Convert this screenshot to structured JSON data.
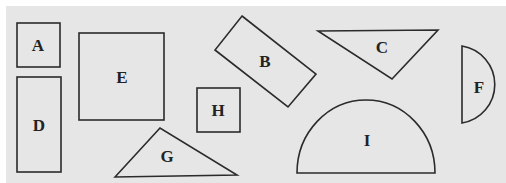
{
  "figure": {
    "background": "#e6e6e6",
    "stroke": "#2b2b2b",
    "shapes": [
      {
        "label": "A",
        "type": "square"
      },
      {
        "label": "B",
        "type": "rotated-rectangle"
      },
      {
        "label": "C",
        "type": "triangle"
      },
      {
        "label": "D",
        "type": "rectangle"
      },
      {
        "label": "E",
        "type": "square"
      },
      {
        "label": "F",
        "type": "semicircle"
      },
      {
        "label": "G",
        "type": "triangle"
      },
      {
        "label": "H",
        "type": "square"
      },
      {
        "label": "I",
        "type": "semicircle"
      }
    ]
  }
}
